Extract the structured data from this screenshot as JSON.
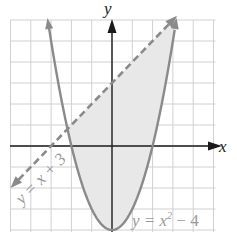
{
  "chart_data": {
    "type": "line",
    "title": "",
    "xlabel": "x",
    "ylabel": "y",
    "xlim": [
      -5,
      5
    ],
    "ylim": [
      -4,
      6
    ],
    "grid": true,
    "legend": "none",
    "series": [
      {
        "name": "y = x + 3",
        "style": "dashed",
        "color": "#888888",
        "x": [
          -5,
          3.16
        ],
        "y": [
          -2,
          6.16
        ]
      },
      {
        "name": "y = x^2 - 4",
        "style": "solid",
        "color": "#888888",
        "domain": [
          -3.16,
          3.16
        ],
        "vertex": [
          0,
          -4
        ],
        "x_intercepts": [
          -2,
          2
        ]
      }
    ],
    "shaded_region": {
      "description": "region between parabola and line",
      "bounds": "x^2 - 4 <= y <= x + 3",
      "x_range": [
        -1.79,
        3.79
      ],
      "color": "#e6e6e6"
    },
    "annotations": [
      {
        "text": "y = x + 3",
        "position": "lower-left, rotated along line"
      },
      {
        "text": "y = x² − 4",
        "position": "lower-right near vertex"
      }
    ]
  },
  "labels": {
    "x_axis": "x",
    "y_axis": "y",
    "line_label": "y = x + 3",
    "parabola_label_base": "y = x",
    "parabola_label_exp": "2",
    "parabola_label_tail": " − 4"
  },
  "colors": {
    "grid": "#d0d0d0",
    "axis": "#1a1a1a",
    "curve": "#8a8a8a",
    "shade": "#e8e8e8",
    "label": "#999999"
  }
}
